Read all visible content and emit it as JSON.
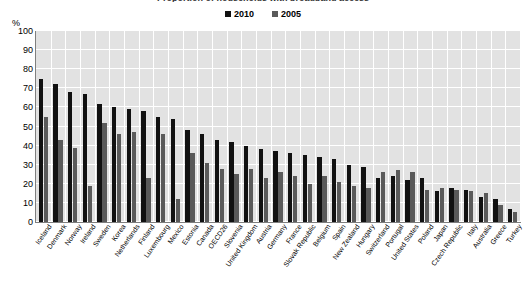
{
  "chart_data": {
    "type": "bar",
    "title": "Proportion of households with broadband access",
    "ylabel": "%",
    "xlabel": "",
    "ylim": [
      0,
      100
    ],
    "ytick_step": 10,
    "yticks": [
      "0",
      "10",
      "20",
      "30",
      "40",
      "50",
      "60",
      "70",
      "80",
      "90",
      "100"
    ],
    "grid": true,
    "legend_position": "top-center",
    "categories": [
      "Iceland",
      "Denmark",
      "Norway",
      "Ireland",
      "Sweden",
      "Korea",
      "Netherlands",
      "Finland",
      "Luxembourg",
      "Mexico",
      "Estonia",
      "Canada",
      "OECD26",
      "Slovenia",
      "United Kingdom",
      "Austria",
      "Germany",
      "France",
      "Slovak Republic",
      "Belgium",
      "Spain",
      "New Zealand",
      "Hungary",
      "Switzerland",
      "Portugal",
      "United States",
      "Poland",
      "Japan",
      "Czech Republic",
      "Italy",
      "Australia",
      "Greece",
      "Turkey"
    ],
    "series": [
      {
        "name": "2010",
        "color": "#111111",
        "values": [
          75,
          72,
          68,
          67,
          62,
          60,
          59,
          58,
          55,
          54,
          48,
          46,
          42,
          41,
          40,
          38,
          37,
          36,
          35,
          34,
          33,
          32,
          31,
          30,
          29,
          24,
          22,
          21,
          20,
          19,
          17,
          14,
          8
        ]
      },
      {
        "name": "2005",
        "color": "#5a5a5a",
        "values": [
          55,
          43,
          39,
          52,
          22,
          52,
          46,
          47,
          46,
          26,
          30,
          28,
          25,
          26,
          24,
          22,
          21,
          20,
          19,
          18,
          17,
          15,
          13,
          11,
          9,
          16,
          14,
          12,
          10,
          9,
          7,
          5,
          3
        ]
      }
    ],
    "plotted": [
      {
        "category": "Iceland",
        "v2010": 75,
        "v2005": 55
      },
      {
        "category": "Denmark",
        "v2010": 72,
        "v2005": 43
      },
      {
        "category": "Norway",
        "v2010": 68,
        "v2005": 39
      },
      {
        "category": "Ireland",
        "v2010": 67,
        "v2005": 19
      },
      {
        "category": "Sweden",
        "v2010": 62,
        "v2005": 52
      },
      {
        "category": "Korea",
        "v2010": 60,
        "v2005": 46
      },
      {
        "category": "Netherlands",
        "v2010": 59,
        "v2005": 47
      },
      {
        "category": "Finland",
        "v2010": 58,
        "v2005": 23
      },
      {
        "category": "Luxembourg",
        "v2010": 55,
        "v2005": 46
      },
      {
        "category": "Mexico",
        "v2010": 54,
        "v2005": 12
      },
      {
        "category": "Estonia",
        "v2010": 48,
        "v2005": 36
      },
      {
        "category": "Canada",
        "v2010": 46,
        "v2005": 31
      },
      {
        "category": "OECD26",
        "v2010": 43,
        "v2005": 28
      },
      {
        "category": "Slovenia",
        "v2010": 42,
        "v2005": 25
      },
      {
        "category": "United Kingdom",
        "v2010": 40,
        "v2005": 28
      },
      {
        "category": "Austria",
        "v2010": 38,
        "v2005": 23
      },
      {
        "category": "Germany",
        "v2010": 37,
        "v2005": 26
      },
      {
        "category": "France",
        "v2010": 36,
        "v2005": 24
      },
      {
        "category": "Slovak Republic",
        "v2010": 35,
        "v2005": 20
      },
      {
        "category": "Belgium",
        "v2010": 34,
        "v2005": 24
      },
      {
        "category": "Spain",
        "v2010": 33,
        "v2005": 21
      },
      {
        "category": "New Zealand",
        "v2010": 30,
        "v2005": 19
      },
      {
        "category": "Hungary",
        "v2010": 29,
        "v2005": 18
      },
      {
        "category": "Switzerland",
        "v2010": 23,
        "v2005": 26
      },
      {
        "category": "Portugal",
        "v2010": 24,
        "v2005": 27
      },
      {
        "category": "United States",
        "v2010": 22,
        "v2005": 26
      },
      {
        "category": "Poland",
        "v2010": 23,
        "v2005": 17
      },
      {
        "category": "Japan",
        "v2010": 16,
        "v2005": 18
      },
      {
        "category": "Czech Republic",
        "v2010": 18,
        "v2005": 17
      },
      {
        "category": "Italy",
        "v2010": 17,
        "v2005": 16
      },
      {
        "category": "Australia",
        "v2010": 13,
        "v2005": 15
      },
      {
        "category": "Greece",
        "v2010": 12,
        "v2005": 9
      },
      {
        "category": "Turkey",
        "v2010": 7,
        "v2005": 5
      }
    ]
  },
  "legend": {
    "items": [
      {
        "label": "2010",
        "color": "#111111"
      },
      {
        "label": "2005",
        "color": "#5a5a5a"
      }
    ]
  },
  "axis": {
    "unit_label": "%"
  },
  "colors": {
    "plot_background": "#e2e2e2",
    "gridline": "#ffffff",
    "axis_line": "#7f7f7f",
    "series_2010": "#111111",
    "series_2005": "#5a5a5a",
    "text": "#000000"
  }
}
